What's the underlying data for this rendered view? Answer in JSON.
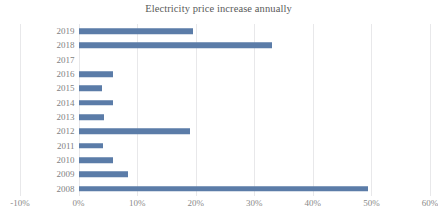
{
  "chart_data": {
    "type": "bar",
    "orientation": "horizontal",
    "title": "Electricity price increase annually",
    "xlabel": "",
    "ylabel": "",
    "categories": [
      "2019",
      "2018",
      "2017",
      "2016",
      "2015",
      "2014",
      "2013",
      "2012",
      "2011",
      "2010",
      "2009",
      "2008"
    ],
    "values": [
      19.5,
      33.0,
      0.0,
      5.9,
      4.0,
      5.8,
      4.3,
      19.0,
      4.2,
      5.8,
      8.5,
      49.5
    ],
    "value_unit": "%",
    "xlim": [
      -10,
      60
    ],
    "x_tick_labels": [
      "-10%",
      "0%",
      "10%",
      "20%",
      "30%",
      "40%",
      "50%",
      "60%"
    ],
    "x_tick_values": [
      -10,
      0,
      10,
      20,
      30,
      40,
      50,
      60
    ],
    "grid": true,
    "grid_axis": "x",
    "legend": false,
    "series": [
      {
        "name": "Electricity price increase",
        "color": "#5b7ca8",
        "values": [
          19.5,
          33.0,
          0.0,
          5.9,
          4.0,
          5.8,
          4.3,
          19.0,
          4.2,
          5.8,
          8.5,
          49.5
        ]
      }
    ]
  },
  "colors": {
    "bar": "#5b7ca8",
    "gridline": "#e8e8ea",
    "title_text": "#595959",
    "axis_text": "#8a8a8a",
    "category_text": "#7f7f7f",
    "background": "#ffffff"
  }
}
